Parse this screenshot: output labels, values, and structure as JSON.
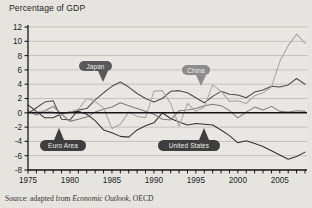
{
  "header": {
    "axis_title": "Percentage of GDP"
  },
  "source": {
    "prefix": "Source: adapted from ",
    "italic_title": "Economic Outlook",
    "suffix": ", OECD"
  },
  "colors": {
    "background": "#e9e7e2",
    "plot_background": "#eceae5",
    "gridline": "#b7b5b0",
    "zero_line": "#101010",
    "axis": "#151515",
    "japan": "#4a4a4a",
    "united_states": "#323232",
    "euro_area": "#7c7c7c",
    "china": "#a9a9a9",
    "callout_dark": "#3c3c3c",
    "callout_mid": "#585858",
    "callout_light": "#8d8d8d"
  },
  "chart_data": {
    "type": "line",
    "title": "Percentage of GDP",
    "subtitle": "",
    "xlabel": "",
    "ylabel": "Percentage of GDP",
    "xlim": [
      1975,
      2008
    ],
    "ylim": [
      -8,
      12
    ],
    "grid": "horizontal",
    "legend": "inline-callouts",
    "zero_line": true,
    "yticks": [
      12,
      10,
      8,
      6,
      4,
      2,
      0,
      -2,
      -4,
      -6,
      -8
    ],
    "ytick_labels": [
      "12",
      "10",
      "8",
      "6",
      "4",
      "2",
      "0",
      "-2",
      "-4",
      "-6",
      "-8"
    ],
    "xtick_step": 1,
    "xtick_labels": [
      {
        "value": 1975,
        "label": "1975"
      },
      {
        "value": 1980,
        "label": "1980"
      },
      {
        "value": 1985,
        "label": "1985"
      },
      {
        "value": 1990,
        "label": "1990"
      },
      {
        "value": 1995,
        "label": "1995"
      },
      {
        "value": 2000,
        "label": "2000"
      },
      {
        "value": 2005,
        "label": "2005"
      }
    ],
    "x": [
      1975,
      1976,
      1977,
      1978,
      1979,
      1980,
      1981,
      1982,
      1983,
      1984,
      1985,
      1986,
      1987,
      1988,
      1989,
      1990,
      1991,
      1992,
      1993,
      1994,
      1995,
      1996,
      1997,
      1998,
      1999,
      2000,
      2001,
      2002,
      2003,
      2004,
      2005,
      2006,
      2007,
      2008
    ],
    "series": [
      {
        "name": "Japan",
        "color": "#4a4a4a",
        "values": [
          -0.1,
          0.7,
          1.5,
          1.7,
          -0.9,
          -1.0,
          0.4,
          0.6,
          1.8,
          2.8,
          3.7,
          4.3,
          3.6,
          2.7,
          2.0,
          1.5,
          2.0,
          3.0,
          3.1,
          2.8,
          2.1,
          1.4,
          2.3,
          3.0,
          2.6,
          2.5,
          2.1,
          2.9,
          3.2,
          3.7,
          3.6,
          3.9,
          4.8,
          4.0
        ]
      },
      {
        "name": "United States",
        "color": "#323232",
        "values": [
          1.1,
          0.2,
          -0.7,
          -0.7,
          -0.1,
          0.1,
          0.2,
          -0.2,
          -1.1,
          -2.4,
          -2.8,
          -3.3,
          -3.4,
          -2.4,
          -1.8,
          -1.4,
          0.0,
          -0.8,
          -1.3,
          -1.7,
          -1.5,
          -1.6,
          -1.7,
          -2.4,
          -3.2,
          -4.2,
          -3.9,
          -4.3,
          -4.7,
          -5.3,
          -5.9,
          -6.5,
          -6.1,
          -5.5
        ]
      },
      {
        "name": "Euro Area",
        "color": "#7c7c7c",
        "values": [
          0.3,
          -0.3,
          0.3,
          0.9,
          -0.2,
          -1.2,
          -0.9,
          -0.6,
          0.1,
          0.5,
          0.8,
          1.4,
          1.0,
          0.6,
          0.2,
          -0.2,
          -0.9,
          -1.0,
          0.3,
          0.4,
          0.6,
          1.0,
          1.2,
          1.0,
          0.3,
          -0.7,
          0.1,
          0.8,
          0.4,
          0.9,
          0.2,
          0.1,
          0.3,
          0.2
        ]
      },
      {
        "name": "China",
        "color": "#a9a9a9",
        "values": [
          0.0,
          0.1,
          0.3,
          0.1,
          -0.3,
          0.1,
          0.5,
          2.0,
          1.6,
          0.7,
          -2.2,
          -1.6,
          0.1,
          -0.5,
          -0.7,
          3.0,
          3.1,
          1.3,
          -1.9,
          1.3,
          0.2,
          0.8,
          3.9,
          3.0,
          1.6,
          1.7,
          1.3,
          2.4,
          2.8,
          3.6,
          7.2,
          9.4,
          11.0,
          9.7
        ]
      }
    ],
    "annotations": [
      {
        "label": "Japan",
        "color": "#585858",
        "box": [
          79,
          61,
          33,
          10
        ],
        "dir": "down",
        "tail_x": 24
      },
      {
        "label": "China",
        "color": "#8d8d8d",
        "box": [
          182,
          65,
          28,
          10
        ],
        "dir": "down",
        "tail_x": 19
      },
      {
        "label": "Euro Area",
        "color": "#3c3c3c",
        "box": [
          40,
          140,
          46,
          11
        ],
        "dir": "up",
        "tail_x": 19
      },
      {
        "label": "United States",
        "color": "#3c3c3c",
        "box": [
          158,
          140,
          62,
          11
        ],
        "dir": "up",
        "tail_x": 46
      }
    ]
  }
}
